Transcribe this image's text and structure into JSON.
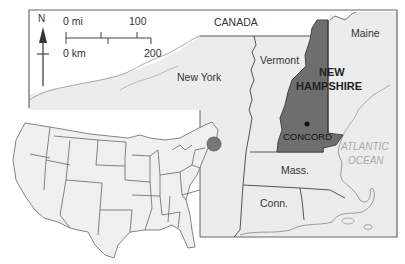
{
  "map": {
    "title": "New Hampshire locator map",
    "labels": {
      "canada": "CANADA",
      "maine": "Maine",
      "vermont": "Vermont",
      "new_york": "New York",
      "nh_line1": "NEW",
      "nh_line2": "HAMPSHIRE",
      "capital": "CONCORD",
      "ocean_line1": "ATLANTIC",
      "ocean_line2": "OCEAN",
      "mass": "Mass.",
      "conn": "Conn."
    },
    "compass": {
      "label": "N"
    },
    "scale_bar": {
      "mi_start": "0 mi",
      "mi_end": "100",
      "km_start": "0 km",
      "km_end": "200"
    },
    "colors": {
      "highlight_state": "#6e6e6e",
      "land": "#ececec",
      "border": "#555555",
      "locator_dot": "#777777",
      "ocean_text": "#aaaaaa"
    },
    "inset": {
      "description": "Contiguous United States with New Hampshire location marked by dot"
    }
  }
}
